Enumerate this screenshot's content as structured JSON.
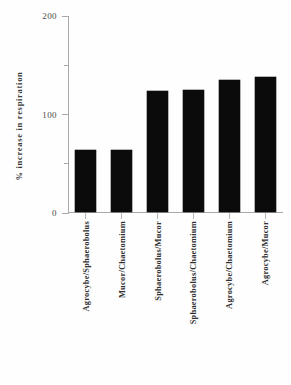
{
  "chart_data": {
    "type": "bar",
    "title": "",
    "subtitle": "",
    "xlabel": "",
    "ylabel": "% increase  in  respiration",
    "ylim": [
      0,
      200
    ],
    "yticks": [
      0,
      50,
      100,
      150,
      200
    ],
    "ytick_labels": [
      "0",
      "",
      "100",
      "",
      "200"
    ],
    "ytick_major": [
      0,
      100,
      200
    ],
    "ytick_minor": [
      50,
      150
    ],
    "grid": false,
    "legend": null,
    "legend_position": "none",
    "bar_color": "#0b0b0b",
    "categories": [
      "Agrocybe/Sphaerobolus",
      "Mucor/Chaetomium",
      "Sphaerobolus/Mucor",
      "Sphaerobolus/Chaetomium",
      "Agrocybe/Chaetomium",
      "Agrocybe/Mucor"
    ],
    "values": [
      63,
      63,
      123,
      124,
      134,
      137
    ],
    "annotations": []
  },
  "axes": {
    "y_title": "% increase  in  respiration",
    "tick_labels": {
      "zero": "0",
      "hundred": "100",
      "twohundred": "200"
    }
  }
}
